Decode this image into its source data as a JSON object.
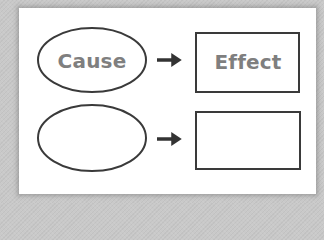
{
  "diagram": {
    "type": "cause-effect",
    "colors": {
      "background": "#c9c9c9",
      "card": "#ffffff",
      "stroke": "#3a3a3a",
      "text": "#7f7f7f",
      "arrow": "#333333"
    },
    "rows": [
      {
        "cause": {
          "shape": "ellipse",
          "label": "Cause"
        },
        "arrow": "arrow-right",
        "effect": {
          "shape": "rectangle",
          "label": "Effect"
        }
      },
      {
        "cause": {
          "shape": "ellipse",
          "label": ""
        },
        "arrow": "arrow-right",
        "effect": {
          "shape": "rectangle",
          "label": ""
        }
      }
    ]
  }
}
